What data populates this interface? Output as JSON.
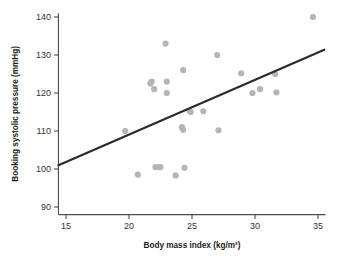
{
  "chart_data": {
    "type": "scatter",
    "title": "",
    "xlabel": "Body mass index (kg/m²)",
    "ylabel": "Booking systolic pressure (mmHg)",
    "xlim": [
      14.4,
      35.6
    ],
    "ylim": [
      88,
      141
    ],
    "grid": false,
    "legend": null,
    "xticks": [
      15,
      20,
      25,
      30,
      35
    ],
    "xtick_labels": [
      "15",
      "20",
      "25",
      "30",
      "35"
    ],
    "yticks": [
      90,
      100,
      110,
      120,
      130,
      140
    ],
    "ytick_labels": [
      "90",
      "100",
      "110",
      "120",
      "130",
      "140"
    ],
    "point_color": "#b5b5b5",
    "line_color": "#2b2b2b",
    "axis_color": "#4d4d4d",
    "series": [
      {
        "name": "participants",
        "marker": "circle",
        "points": [
          {
            "x": 19.7,
            "y": 110.0
          },
          {
            "x": 20.7,
            "y": 98.5
          },
          {
            "x": 21.7,
            "y": 122.5
          },
          {
            "x": 21.8,
            "y": 123.0
          },
          {
            "x": 22.0,
            "y": 121.0
          },
          {
            "x": 22.1,
            "y": 100.5
          },
          {
            "x": 22.4,
            "y": 100.5
          },
          {
            "x": 22.5,
            "y": 100.5
          },
          {
            "x": 22.9,
            "y": 133.0
          },
          {
            "x": 23.0,
            "y": 123.0
          },
          {
            "x": 23.0,
            "y": 120.0
          },
          {
            "x": 23.7,
            "y": 98.3
          },
          {
            "x": 24.2,
            "y": 111.0
          },
          {
            "x": 24.3,
            "y": 110.3
          },
          {
            "x": 24.3,
            "y": 126.0
          },
          {
            "x": 24.4,
            "y": 100.3
          },
          {
            "x": 24.8,
            "y": 115.3
          },
          {
            "x": 24.9,
            "y": 115.0
          },
          {
            "x": 25.9,
            "y": 115.2
          },
          {
            "x": 27.0,
            "y": 130.0
          },
          {
            "x": 27.1,
            "y": 110.2
          },
          {
            "x": 28.9,
            "y": 125.2
          },
          {
            "x": 29.8,
            "y": 120.0
          },
          {
            "x": 30.4,
            "y": 121.0
          },
          {
            "x": 31.6,
            "y": 125.0
          },
          {
            "x": 31.7,
            "y": 120.2
          },
          {
            "x": 34.6,
            "y": 140.0
          }
        ]
      }
    ],
    "fit_line": {
      "name": "regression-line",
      "x_start": 14.4,
      "y_start": 101.0,
      "x_end": 35.5,
      "y_end": 131.4
    }
  }
}
